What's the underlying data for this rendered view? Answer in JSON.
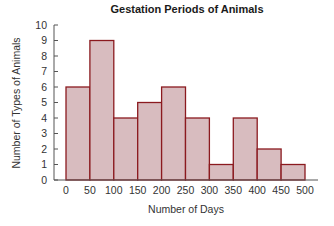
{
  "chart_data": {
    "type": "bar",
    "title": "Gestation Periods of Animals",
    "xlabel": "Number of Days",
    "ylabel": "Number of Types of Animals",
    "bin_edges": [
      0,
      50,
      100,
      150,
      200,
      250,
      300,
      350,
      400,
      450,
      500
    ],
    "categories": [
      "0-50",
      "50-100",
      "100-150",
      "150-200",
      "200-250",
      "250-300",
      "300-350",
      "350-400",
      "400-450",
      "450-500"
    ],
    "values": [
      6,
      9,
      4,
      5,
      6,
      4,
      1,
      4,
      2,
      1
    ],
    "x_tick_labels": [
      "0",
      "50",
      "100",
      "150",
      "200",
      "250",
      "300",
      "350",
      "400",
      "450",
      "500"
    ],
    "y_tick_labels": [
      "0",
      "1",
      "2",
      "3",
      "4",
      "5",
      "6",
      "7",
      "8",
      "9",
      "10"
    ],
    "xlim": [
      0,
      500
    ],
    "ylim": [
      0,
      10
    ],
    "grid": false,
    "colors": {
      "bar_fill": "#d8bcbf",
      "bar_stroke": "#8b1a1f",
      "axis": "#555555"
    }
  }
}
